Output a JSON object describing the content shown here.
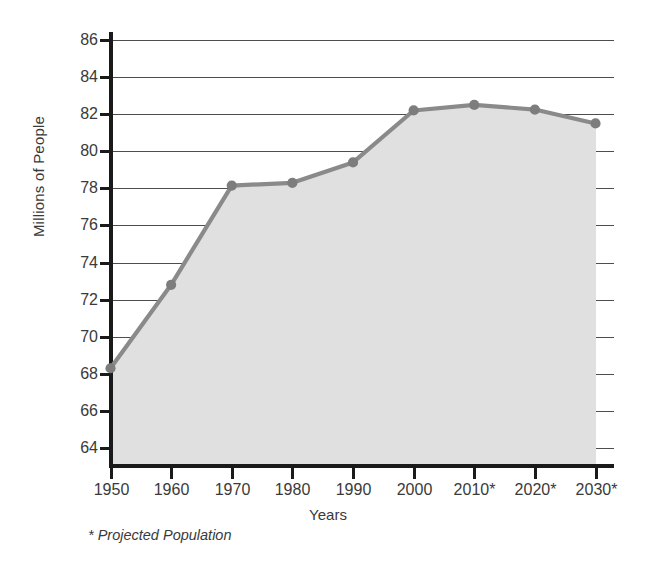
{
  "chart_data": {
    "type": "line",
    "title": "",
    "subtitle": "",
    "xlabel": "Years",
    "ylabel": "Millions of People",
    "categories": [
      "1950",
      "1960",
      "1970",
      "1980",
      "1990",
      "2000",
      "2010*",
      "2020*",
      "2030*"
    ],
    "x": [
      1950,
      1960,
      1970,
      1980,
      1990,
      2000,
      2010,
      2020,
      2030
    ],
    "values": [
      68.3,
      72.8,
      78.15,
      78.3,
      79.4,
      82.2,
      82.5,
      82.25,
      81.5
    ],
    "series": [
      {
        "name": "Population",
        "values": [
          68.3,
          72.8,
          78.15,
          78.3,
          79.4,
          82.2,
          82.5,
          82.25,
          81.5
        ]
      }
    ],
    "ylim": [
      63,
      86
    ],
    "yticks": [
      86,
      84,
      82,
      80,
      78,
      76,
      74,
      72,
      70,
      68,
      66,
      64
    ],
    "ytick_labels": [
      "86",
      "84",
      "82",
      "80",
      "78",
      "76",
      "74",
      "72",
      "70",
      "68",
      "66",
      "64"
    ],
    "grid": true,
    "grid_axis": "y",
    "legend": false,
    "legend_position": "none",
    "annotations": [
      "* Projected Population"
    ],
    "area_fill": true,
    "colors": {
      "line": "#8a8a8a",
      "marker": "#7d7d7d",
      "area_fill": "#e0e0e0",
      "grid": "#4d4d4d",
      "axis": "#1a1a1a",
      "text": "#3a3a3a"
    }
  },
  "footnote": {
    "text": "* Projected Population"
  },
  "axis": {
    "x_title": "Years",
    "y_title": "Millions of People"
  }
}
